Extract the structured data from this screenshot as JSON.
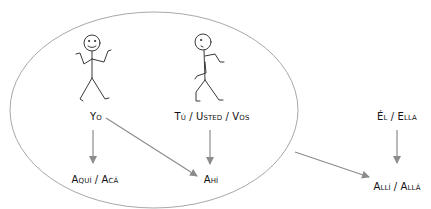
{
  "colors": {
    "ellipse_stroke": "#a8a8a8",
    "arrow_stroke": "#8c8c8c",
    "figure_stroke": "#3a3a3a",
    "text": "#111111",
    "background": "#ffffff"
  },
  "group": {
    "name": "speaker-and-listener-sphere"
  },
  "figures": [
    {
      "id": "yo-figure",
      "pose": "shrugging, smiling"
    },
    {
      "id": "tu-figure",
      "pose": "walking"
    }
  ],
  "labels": {
    "yo": "Yo",
    "tu_usted_vos": "Tú / Usted / Vos",
    "el_ella": "Él / Ella",
    "aqui_aca": "Aquí / Acá",
    "ahi": "Ahí",
    "alli_alla": "Allí / Allá"
  },
  "relations": [
    {
      "from": "Yo",
      "to": "Aquí / Acá"
    },
    {
      "from": "Yo",
      "to": "Ahí"
    },
    {
      "from": "Tú / Usted / Vos",
      "to": "Ahí"
    },
    {
      "from": "Él / Ella",
      "to": "Allí / Allá"
    },
    {
      "from": "sphere",
      "to": "Allí / Allá"
    }
  ]
}
